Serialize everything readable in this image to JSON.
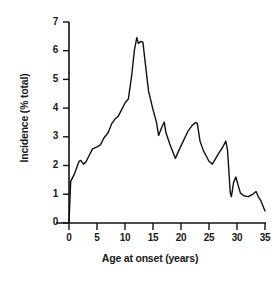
{
  "chart_data": {
    "type": "line",
    "title": "",
    "xlabel": "Age at onset (years)",
    "ylabel": "Incidence (% total)",
    "xlim": [
      0,
      35
    ],
    "ylim": [
      0,
      7
    ],
    "xticks": [
      0,
      5,
      10,
      15,
      20,
      25,
      30,
      35
    ],
    "yticks": [
      0,
      1,
      2,
      3,
      4,
      5,
      6,
      7
    ],
    "xtick_labels": [
      "0",
      "5",
      "10",
      "15",
      "20",
      "25",
      "30",
      "35"
    ],
    "ytick_labels": [
      "0",
      "1",
      "2",
      "3",
      "4",
      "5",
      "6",
      "7"
    ],
    "grid": false,
    "legend": null,
    "line_color": "#111111",
    "line_width": 1.4,
    "series": [
      {
        "name": "Incidence",
        "x": [
          0,
          0.3,
          1.0,
          1.8,
          2.1,
          2.6,
          3.0,
          3.6,
          4.2,
          5.0,
          5.6,
          6.2,
          7.0,
          7.6,
          8.2,
          8.8,
          9.4,
          10.0,
          10.6,
          11.2,
          11.7,
          12.1,
          12.4,
          12.8,
          13.2,
          13.6,
          14.2,
          15.0,
          15.6,
          16.0,
          16.5,
          17.0,
          17.3,
          18.0,
          18.6,
          19.0,
          19.6,
          20.4,
          21.2,
          22.0,
          22.6,
          22.9,
          23.4,
          24.0,
          24.6,
          25.0,
          25.6,
          26.2,
          26.8,
          27.4,
          28.0,
          28.3,
          28.8,
          29.0,
          29.4,
          29.8,
          30.2,
          30.6,
          31.2,
          32.0,
          32.8,
          33.4,
          33.8,
          34.2,
          35.0
        ],
        "y": [
          0.0,
          1.45,
          1.72,
          2.15,
          2.18,
          2.05,
          2.12,
          2.35,
          2.58,
          2.65,
          2.72,
          2.95,
          3.15,
          3.45,
          3.62,
          3.72,
          3.95,
          4.18,
          4.32,
          5.15,
          6.05,
          6.45,
          6.25,
          6.32,
          6.3,
          5.6,
          4.6,
          3.95,
          3.52,
          3.05,
          3.3,
          3.52,
          3.15,
          2.75,
          2.45,
          2.25,
          2.52,
          2.85,
          3.18,
          3.4,
          3.5,
          3.48,
          2.85,
          2.52,
          2.3,
          2.15,
          2.05,
          2.25,
          2.45,
          2.62,
          2.85,
          2.55,
          1.05,
          0.92,
          1.42,
          1.6,
          1.32,
          1.05,
          0.95,
          0.92,
          1.0,
          1.1,
          0.92,
          0.8,
          0.42
        ]
      }
    ]
  },
  "axes": {
    "x_title": "Age at onset (years)",
    "y_title": "Incidence (% total)"
  }
}
